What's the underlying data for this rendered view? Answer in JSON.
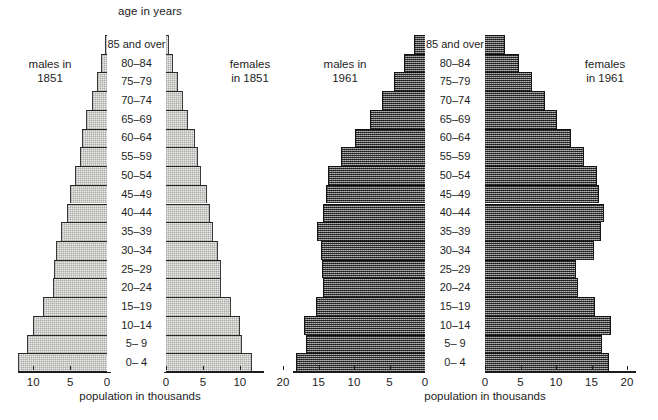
{
  "figure": {
    "top_title": "age in years",
    "axis_title_left": "population in thousands",
    "axis_title_right": "population in thousands"
  },
  "age_groups": [
    "85 and over",
    "80–84",
    "75–79",
    "70–74",
    "65–69",
    "60–64",
    "55–59",
    "50–54",
    "45–49",
    "40–44",
    "35–39",
    "30–34",
    "25–29",
    "20–24",
    "15–19",
    "10–14",
    "5– 9",
    "0– 4"
  ],
  "panels": [
    {
      "id": "1851",
      "left_label": "males in\n1851",
      "left_label_line1": "males in",
      "left_label_line2": "1851",
      "right_label_line1": "females",
      "right_label_line2": "in 1851",
      "axis_title": "population in thousands",
      "left_ticks": [
        "10",
        "5",
        "0"
      ],
      "right_ticks": [
        "0",
        "5",
        "10"
      ],
      "axis_max": 12.5
    },
    {
      "id": "1961",
      "left_label_line1": "males in",
      "left_label_line2": "1961",
      "right_label_line1": "females",
      "right_label_line2": "in 1961",
      "axis_title": "population in thousands",
      "left_ticks": [
        "20",
        "15",
        "10",
        "5",
        "0"
      ],
      "right_ticks": [
        "0",
        "5",
        "10",
        "15",
        "20"
      ],
      "axis_max": 20.5
    }
  ],
  "chart_data": [
    {
      "type": "bar",
      "subtype": "population-pyramid",
      "title": "age in years",
      "panel": "1851",
      "xlabel": "population in thousands",
      "ylabel": "age in years",
      "categories": [
        "85 and over",
        "80–84",
        "75–79",
        "70–74",
        "65–69",
        "60–64",
        "55–59",
        "50–54",
        "45–49",
        "40–44",
        "35–39",
        "30–34",
        "25–29",
        "20–24",
        "15–19",
        "10–14",
        "5– 9",
        "0– 4"
      ],
      "series": [
        {
          "name": "males in 1851",
          "side": "left",
          "values": [
            0.3,
            0.8,
            1.3,
            2.0,
            2.8,
            3.4,
            3.6,
            4.3,
            5.0,
            5.4,
            6.3,
            6.9,
            7.2,
            7.3,
            8.7,
            10.0,
            10.9,
            12.0
          ]
        },
        {
          "name": "females in 1851",
          "side": "right",
          "values": [
            0.4,
            0.9,
            1.6,
            2.3,
            3.0,
            3.9,
            4.4,
            4.8,
            5.6,
            5.9,
            6.4,
            7.0,
            7.5,
            7.5,
            8.8,
            10.0,
            10.3,
            11.7
          ]
        }
      ],
      "xlim": [
        0,
        12.5
      ],
      "xticks_left": [
        10,
        5,
        0
      ],
      "xticks_right": [
        0,
        5,
        10
      ],
      "grid": false,
      "legend": "side-labels"
    },
    {
      "type": "bar",
      "subtype": "population-pyramid",
      "title": "age in years",
      "panel": "1961",
      "xlabel": "population in thousands",
      "ylabel": "age in years",
      "categories": [
        "85 and over",
        "80–84",
        "75–79",
        "70–74",
        "65–69",
        "60–64",
        "55–59",
        "50–54",
        "45–49",
        "40–44",
        "35–39",
        "30–34",
        "25–29",
        "20–24",
        "15–19",
        "10–14",
        "5– 9",
        "0– 4"
      ],
      "series": [
        {
          "name": "males in 1961",
          "side": "left",
          "values": [
            1.5,
            3.0,
            4.4,
            6.0,
            7.8,
            9.8,
            11.8,
            13.7,
            14.0,
            14.4,
            15.2,
            14.6,
            14.5,
            14.3,
            15.4,
            17.0,
            16.8,
            18.2
          ]
        },
        {
          "name": "females in 1961",
          "side": "right",
          "values": [
            2.8,
            4.8,
            6.6,
            8.4,
            10.2,
            12.1,
            13.9,
            15.8,
            16.1,
            16.7,
            16.4,
            15.3,
            12.8,
            13.1,
            15.5,
            17.8,
            16.5,
            17.4
          ]
        }
      ],
      "xlim": [
        0,
        20.5
      ],
      "xticks_left": [
        20,
        15,
        10,
        5,
        0
      ],
      "xticks_right": [
        0,
        5,
        10,
        15,
        20
      ],
      "grid": false,
      "legend": "side-labels"
    }
  ],
  "style": {
    "fill_1851": "#ebebe8",
    "fill_1961": "#5d5d5d",
    "axis_color": "#1c1c1c",
    "text_color": "#1d1d1d",
    "background": "#ffffff"
  }
}
